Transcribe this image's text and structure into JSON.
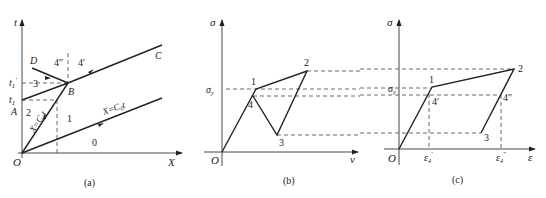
{
  "header_fragment": "（cut-off caption text）",
  "panels": {
    "a": {
      "caption": "(a)",
      "axis_x": "X",
      "axis_y": "t",
      "origin": "O",
      "tick_t1": "t",
      "tick_t1_sub": "1",
      "tick_t1p": "t",
      "tick_t1p_sub": "1",
      "tick_t1p_prime": "′",
      "point_A": "A",
      "point_B": "B",
      "point_C": "C",
      "point_D": "D",
      "region_0": "0",
      "region_1": "1",
      "region_2": "2",
      "region_3": "3",
      "region_4pp": "4″",
      "region_4p": "4′",
      "line_c0": "X=C",
      "line_c0_sub": "0",
      "line_c0_t": "t",
      "line_c1": "X=C",
      "line_c1_sub": "1",
      "line_c1_t": "t"
    },
    "b": {
      "caption": "(b)",
      "axis_x": "v",
      "axis_y": "σ",
      "origin": "O",
      "sigma_y": "σ",
      "sigma_y_sub": "y",
      "p1": "1",
      "p2": "2",
      "p3": "3",
      "p4": "4"
    },
    "c": {
      "caption": "(c)",
      "axis_x": "ε",
      "axis_y": "σ",
      "origin": "O",
      "sigma_y": "σ",
      "sigma_y_sub": "y",
      "p1": "1",
      "p2": "2",
      "p3": "3",
      "p4p": "4′",
      "p4pp": "4″",
      "eps4p": "ε",
      "eps4p_sub": "4",
      "eps4p_sup": "′",
      "eps4pp": "ε",
      "eps4pp_sub": "4",
      "eps4pp_sup": "″"
    }
  }
}
